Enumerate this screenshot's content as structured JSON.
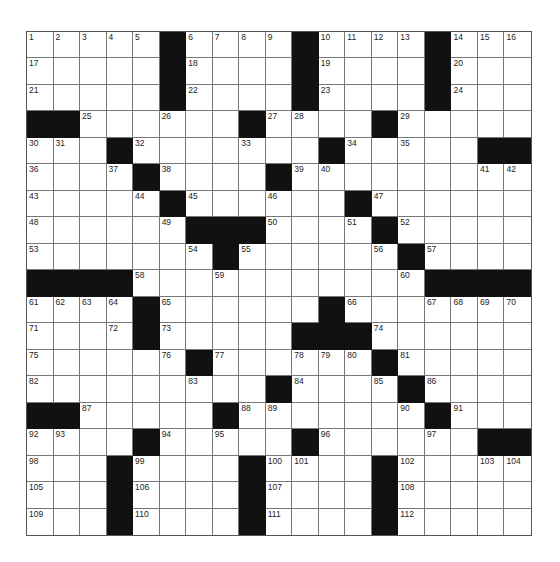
{
  "puzzle": {
    "rows": 19,
    "cols": 19,
    "layout": [
      ".....#....#....#...",
      ".....#....#....#...",
      ".....#....#....#...",
      "##......#....#.....",
      "...#.......#.....##",
      "....#....#.........",
      ".....#......#......",
      "......###....#.....",
      ".......#......#....",
      "####...........####",
      "....#......#.......",
      "....#.....###......",
      "......#......#.....",
      ".........#....#....",
      "##.....#.......#...",
      "....#.....#......##",
      "...#....#....#.....",
      "...#....#....#.....",
      "...#....#....#....."
    ],
    "numbers": [
      [
        0,
        0,
        1
      ],
      [
        0,
        1,
        2
      ],
      [
        0,
        2,
        3
      ],
      [
        0,
        3,
        4
      ],
      [
        0,
        4,
        5
      ],
      [
        0,
        6,
        6
      ],
      [
        0,
        7,
        7
      ],
      [
        0,
        8,
        8
      ],
      [
        0,
        9,
        9
      ],
      [
        0,
        11,
        10
      ],
      [
        0,
        12,
        11
      ],
      [
        0,
        13,
        12
      ],
      [
        0,
        14,
        13
      ],
      [
        0,
        16,
        14
      ],
      [
        0,
        17,
        15
      ],
      [
        0,
        18,
        16
      ],
      [
        1,
        0,
        17
      ],
      [
        1,
        6,
        18
      ],
      [
        1,
        11,
        19
      ],
      [
        1,
        16,
        20
      ],
      [
        2,
        0,
        21
      ],
      [
        2,
        6,
        22
      ],
      [
        2,
        11,
        23
      ],
      [
        2,
        16,
        24
      ],
      [
        3,
        2,
        25
      ],
      [
        3,
        5,
        26
      ],
      [
        3,
        9,
        27
      ],
      [
        3,
        10,
        28
      ],
      [
        3,
        14,
        29
      ],
      [
        4,
        0,
        30
      ],
      [
        4,
        1,
        31
      ],
      [
        4,
        4,
        32
      ],
      [
        4,
        8,
        33
      ],
      [
        4,
        12,
        34
      ],
      [
        4,
        14,
        35
      ],
      [
        5,
        0,
        36
      ],
      [
        5,
        3,
        37
      ],
      [
        5,
        5,
        38
      ],
      [
        5,
        10,
        39
      ],
      [
        5,
        11,
        40
      ],
      [
        5,
        17,
        41
      ],
      [
        5,
        18,
        42
      ],
      [
        6,
        0,
        43
      ],
      [
        6,
        4,
        44
      ],
      [
        6,
        6,
        45
      ],
      [
        6,
        9,
        46
      ],
      [
        6,
        13,
        47
      ],
      [
        7,
        0,
        48
      ],
      [
        7,
        5,
        49
      ],
      [
        7,
        9,
        50
      ],
      [
        7,
        12,
        51
      ],
      [
        7,
        14,
        52
      ],
      [
        8,
        0,
        53
      ],
      [
        8,
        6,
        54
      ],
      [
        8,
        8,
        55
      ],
      [
        8,
        13,
        56
      ],
      [
        8,
        15,
        57
      ],
      [
        9,
        4,
        58
      ],
      [
        9,
        7,
        59
      ],
      [
        9,
        14,
        60
      ],
      [
        10,
        0,
        61
      ],
      [
        10,
        1,
        62
      ],
      [
        10,
        2,
        63
      ],
      [
        10,
        3,
        64
      ],
      [
        10,
        5,
        65
      ],
      [
        10,
        12,
        66
      ],
      [
        10,
        15,
        67
      ],
      [
        10,
        16,
        68
      ],
      [
        10,
        17,
        69
      ],
      [
        10,
        18,
        70
      ],
      [
        11,
        0,
        71
      ],
      [
        11,
        3,
        72
      ],
      [
        11,
        5,
        73
      ],
      [
        11,
        13,
        74
      ],
      [
        12,
        0,
        75
      ],
      [
        12,
        5,
        76
      ],
      [
        12,
        7,
        77
      ],
      [
        12,
        10,
        78
      ],
      [
        12,
        11,
        79
      ],
      [
        12,
        12,
        80
      ],
      [
        12,
        14,
        81
      ],
      [
        13,
        0,
        82
      ],
      [
        13,
        6,
        83
      ],
      [
        13,
        10,
        84
      ],
      [
        13,
        13,
        85
      ],
      [
        13,
        15,
        86
      ],
      [
        14,
        2,
        87
      ],
      [
        14,
        8,
        88
      ],
      [
        14,
        9,
        89
      ],
      [
        14,
        14,
        90
      ],
      [
        14,
        16,
        91
      ],
      [
        15,
        0,
        92
      ],
      [
        15,
        1,
        93
      ],
      [
        15,
        5,
        94
      ],
      [
        15,
        7,
        95
      ],
      [
        15,
        11,
        96
      ],
      [
        15,
        15,
        97
      ],
      [
        16,
        0,
        98
      ],
      [
        16,
        4,
        99
      ],
      [
        16,
        9,
        100
      ],
      [
        16,
        10,
        101
      ],
      [
        16,
        14,
        102
      ],
      [
        16,
        17,
        103
      ],
      [
        16,
        18,
        104
      ],
      [
        17,
        0,
        105
      ],
      [
        17,
        4,
        106
      ],
      [
        17,
        9,
        107
      ],
      [
        17,
        14,
        108
      ],
      [
        18,
        0,
        109
      ],
      [
        18,
        4,
        110
      ],
      [
        18,
        9,
        111
      ],
      [
        18,
        14,
        112
      ]
    ],
    "colors": {
      "block": "#111111",
      "cell": "#ffffff",
      "line": "#777777",
      "number": "#222222"
    }
  }
}
